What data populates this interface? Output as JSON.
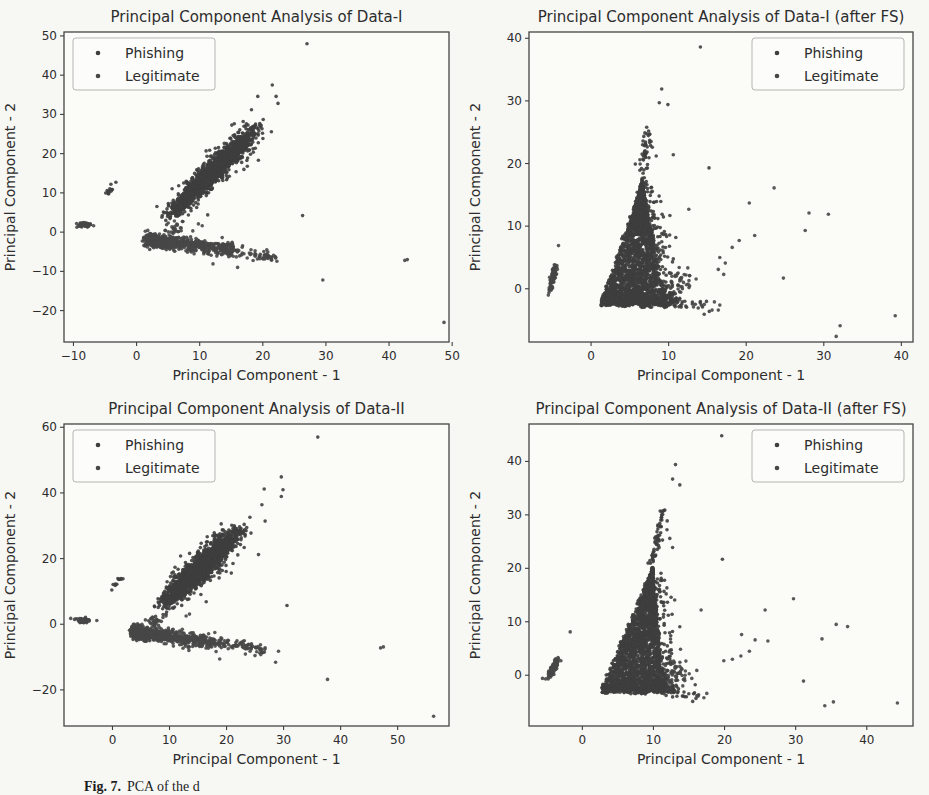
{
  "caption": {
    "label": "Fig. 7.",
    "text": "PCA of the d"
  },
  "colors": {
    "ink": "#2d2d2d",
    "tick": "#3f3f3f",
    "plot_border": "#454545",
    "plot_bg": "#fbfbf8",
    "paper_bg": "#f7f7f4",
    "legend_border": "#b5b5b0"
  },
  "chart_data": [
    {
      "type": "scatter",
      "title": "Principal Component Analysis of Data-I",
      "xlabel": "Principal Component - 1",
      "ylabel": "Principal Component - 2",
      "xlim": [
        -11.5,
        49.5
      ],
      "ylim": [
        -28,
        51
      ],
      "xticks": [
        -10,
        0,
        10,
        20,
        30,
        40,
        50
      ],
      "yticks": [
        -20,
        -10,
        0,
        10,
        20,
        30,
        40,
        50
      ],
      "legend": {
        "position": "top-left",
        "entries": [
          "Phishing",
          "Legitimate"
        ]
      },
      "seed": 101,
      "series": [
        {
          "name": "Phishing",
          "color": "#3e3e3e",
          "clusters": [
            {
              "shape": "band",
              "x0": 4.6,
              "y0": 3.2,
              "x1": 19.5,
              "y1": 27.0,
              "sigma": 1.15,
              "count": 1700,
              "bias": "center"
            },
            {
              "shape": "band",
              "x0": 5.0,
              "y0": 4.0,
              "x1": 20.5,
              "y1": 28.0,
              "sigma": 2.3,
              "count": 220,
              "bias": "center"
            },
            {
              "shape": "streak",
              "x0": -4.6,
              "y0": 9.8,
              "x1": -3.1,
              "y1": 13.2,
              "count": 12,
              "jitter": 0.25
            },
            {
              "shape": "points",
              "pts": [
                [
                  27,
                  48
                ],
                [
                  21.5,
                  37.5
                ],
                [
                  19.2,
                  34.6
                ],
                [
                  22.1,
                  34.6
                ],
                [
                  22.4,
                  32.8
                ],
                [
                  18.2,
                  31.2
                ],
                [
                  16.9,
                  28.2
                ],
                [
                  17.4,
                  27.6
                ],
                [
                  19.3,
                  18.3
                ],
                [
                  26.3,
                  4.2
                ],
                [
                  14.8,
                  23.9
                ],
                [
                  16.2,
                  25.4
                ]
              ]
            }
          ]
        },
        {
          "name": "Legitimate",
          "color": "#474747",
          "clusters": [
            {
              "shape": "band",
              "x0": 2.0,
              "y0": -2.0,
              "x1": 15.5,
              "y1": -4.6,
              "sigma": 0.85,
              "count": 650,
              "bias": "left"
            },
            {
              "shape": "band",
              "x0": 14.5,
              "y0": -4.6,
              "x1": 21.8,
              "y1": -6.8,
              "sigma": 0.8,
              "count": 70,
              "bias": "uniform"
            },
            {
              "shape": "blob",
              "cx": -8.3,
              "cy": 1.9,
              "rx": 1.0,
              "ry": 0.55,
              "count": 60
            },
            {
              "shape": "blob",
              "cx": 5.8,
              "cy": 1.2,
              "rx": 1.3,
              "ry": 1.5,
              "count": 26
            },
            {
              "shape": "points",
              "pts": [
                [
                  29.5,
                  -12.2
                ],
                [
                  42.5,
                  -7.2
                ],
                [
                  42.9,
                  -7.0
                ],
                [
                  48.7,
                  -23
                ],
                [
                  16,
                  -9
                ],
                [
                  12.1,
                  -8.1
                ],
                [
                  9.8,
                  2.1
                ],
                [
                  10.4,
                  1.6
                ],
                [
                  8.9,
                  0.3
                ],
                [
                  14.6,
                  -6.3
                ],
                [
                  11.8,
                  -5.9
                ],
                [
                  13.4,
                  -5.6
                ]
              ]
            }
          ]
        }
      ]
    },
    {
      "type": "scatter",
      "title": "Principal Component Analysis of Data-I (after FS)",
      "xlabel": "Principal Component - 1",
      "ylabel": "Principal Component - 2",
      "xlim": [
        -8,
        41.5
      ],
      "ylim": [
        -8.5,
        41
      ],
      "xticks": [
        0,
        10,
        20,
        30,
        40
      ],
      "yticks": [
        0,
        10,
        20,
        30,
        40
      ],
      "legend": {
        "position": "top-right",
        "entries": [
          "Phishing",
          "Legitimate"
        ]
      },
      "seed": 202,
      "series": [
        {
          "name": "Phishing",
          "color": "#3e3e3e",
          "clusters": [
            {
              "shape": "triangle",
              "bx0": 1.2,
              "bx1": 9.6,
              "by": -2.4,
              "ax": 6.6,
              "ay": 16.8,
              "count": 2500,
              "edge": 0.45
            },
            {
              "shape": "band",
              "x0": 6.6,
              "y0": 16.8,
              "x1": 7.3,
              "y1": 25.6,
              "sigma": 0.55,
              "count": 50,
              "bias": "uniform"
            },
            {
              "shape": "band",
              "x0": 9.8,
              "y0": -2.2,
              "x1": 15.8,
              "y1": -3.0,
              "sigma": 0.55,
              "count": 40,
              "bias": "left"
            },
            {
              "shape": "points",
              "pts": [
                [
                  14.1,
                  38.6
                ],
                [
                  9.1,
                  31.9
                ],
                [
                  8.8,
                  29.7
                ],
                [
                  9.9,
                  29.4
                ],
                [
                  15.2,
                  19.3
                ],
                [
                  10.6,
                  21.4
                ],
                [
                  5.7,
                  19.9
                ],
                [
                  6.3,
                  20.6
                ],
                [
                  7.9,
                  22.6
                ],
                [
                  8.4,
                  21.2
                ]
              ]
            }
          ]
        },
        {
          "name": "Legitimate",
          "color": "#474747",
          "clusters": [
            {
              "shape": "band",
              "x0": -5.4,
              "y0": -1.0,
              "x1": -4.5,
              "y1": 4.0,
              "sigma": 0.33,
              "count": 85,
              "bias": "center"
            },
            {
              "shape": "blob",
              "cx": 11.6,
              "cy": 1.4,
              "rx": 1.2,
              "ry": 2.4,
              "count": 32
            },
            {
              "shape": "points",
              "pts": [
                [
                  -4.2,
                  6.9
                ],
                [
                  16.6,
                  5.0
                ],
                [
                  17.3,
                  4.1
                ],
                [
                  16.4,
                  3.1
                ],
                [
                  17.1,
                  2.3
                ],
                [
                  18.2,
                  6.6
                ],
                [
                  19.1,
                  7.7
                ],
                [
                  21.1,
                  8.5
                ],
                [
                  20.4,
                  13.7
                ],
                [
                  23.6,
                  16.1
                ],
                [
                  28.1,
                  12.1
                ],
                [
                  30.6,
                  11.9
                ],
                [
                  27.6,
                  9.3
                ],
                [
                  24.8,
                  1.7
                ],
                [
                  12.6,
                  12.7
                ],
                [
                  14.6,
                  -2.5
                ],
                [
                  15.6,
                  -3.4
                ],
                [
                  16.4,
                  -3.4
                ],
                [
                  31.6,
                  -7.6
                ],
                [
                  32.1,
                  -5.9
                ],
                [
                  39.2,
                  -4.3
                ],
                [
                  13.2,
                  -2.9
                ],
                [
                  15.9,
                  -2.1
                ],
                [
                  16.6,
                  -2.6
                ]
              ]
            }
          ]
        }
      ]
    },
    {
      "type": "scatter",
      "title": "Principal Component Analysis of Data-II",
      "xlabel": "Principal Component - 1",
      "ylabel": "Principal Component - 2",
      "xlim": [
        -8.5,
        59
      ],
      "ylim": [
        -31,
        61
      ],
      "xticks": [
        0,
        10,
        20,
        30,
        40,
        50
      ],
      "yticks": [
        -20,
        0,
        20,
        40,
        60
      ],
      "legend": {
        "position": "top-left",
        "entries": [
          "Phishing",
          "Legitimate"
        ]
      },
      "seed": 303,
      "series": [
        {
          "name": "Phishing",
          "color": "#3e3e3e",
          "clusters": [
            {
              "shape": "band",
              "x0": 8.2,
              "y0": 4.8,
              "x1": 22.5,
              "y1": 29.0,
              "sigma": 1.5,
              "count": 1800,
              "bias": "center"
            },
            {
              "shape": "band",
              "x0": 9.0,
              "y0": 6.0,
              "x1": 23.5,
              "y1": 30.5,
              "sigma": 2.9,
              "count": 230,
              "bias": "center"
            },
            {
              "shape": "streak",
              "x0": -0.4,
              "y0": 9.9,
              "x1": 1.7,
              "y1": 14.3,
              "count": 11,
              "jitter": 0.3
            },
            {
              "shape": "points",
              "pts": [
                [
                  36,
                  57
                ],
                [
                  29.6,
                  44.9
                ],
                [
                  26.6,
                  41.2
                ],
                [
                  29.9,
                  41
                ],
                [
                  29.6,
                  38.9
                ],
                [
                  26.2,
                  36.4
                ],
                [
                  24.1,
                  32.6
                ],
                [
                  23.1,
                  30.4
                ],
                [
                  25.6,
                  21.2
                ],
                [
                  30.6,
                  5.7
                ],
                [
                  20.6,
                  26.4
                ],
                [
                  22.1,
                  28.1
                ]
              ]
            }
          ]
        },
        {
          "name": "Legitimate",
          "color": "#474747",
          "clusters": [
            {
              "shape": "band",
              "x0": 4.0,
              "y0": -2.6,
              "x1": 18.0,
              "y1": -5.4,
              "sigma": 1.0,
              "count": 700,
              "bias": "left"
            },
            {
              "shape": "band",
              "x0": 17.0,
              "y0": -5.2,
              "x1": 26.5,
              "y1": -7.8,
              "sigma": 0.9,
              "count": 90,
              "bias": "uniform"
            },
            {
              "shape": "blob",
              "cx": -5.1,
              "cy": 1.2,
              "rx": 1.1,
              "ry": 0.6,
              "count": 70
            },
            {
              "shape": "blob",
              "cx": 7.3,
              "cy": 0.8,
              "rx": 1.5,
              "ry": 1.7,
              "count": 30
            },
            {
              "shape": "points",
              "pts": [
                [
                  37.7,
                  -16.8
                ],
                [
                  47,
                  -7.2
                ],
                [
                  47.5,
                  -6.9
                ],
                [
                  56.3,
                  -28
                ],
                [
                  28.6,
                  -11.6
                ],
                [
                  18.8,
                  -10.6
                ],
                [
                  23.3,
                  -9.1
                ],
                [
                  29.1,
                  -8.2
                ],
                [
                  12.9,
                  2.5
                ],
                [
                  13.5,
                  3.1
                ]
              ]
            }
          ]
        }
      ]
    },
    {
      "type": "scatter",
      "title": "Principal Component Analysis of Data-II (after FS)",
      "xlabel": "Principal Component - 1",
      "ylabel": "Principal Component - 2",
      "xlim": [
        -7.5,
        46.5
      ],
      "ylim": [
        -9.5,
        47
      ],
      "xticks": [
        0,
        10,
        20,
        30,
        40
      ],
      "yticks": [
        0,
        10,
        20,
        30,
        40
      ],
      "legend": {
        "position": "top-right",
        "entries": [
          "Phishing",
          "Legitimate"
        ]
      },
      "seed": 404,
      "series": [
        {
          "name": "Phishing",
          "color": "#3e3e3e",
          "clusters": [
            {
              "shape": "triangle",
              "bx0": 2.6,
              "bx1": 11.6,
              "by": -2.9,
              "ax": 9.9,
              "ay": 19.8,
              "count": 2500,
              "edge": 0.5
            },
            {
              "shape": "band",
              "x0": 9.9,
              "y0": 19.8,
              "x1": 11.2,
              "y1": 30.6,
              "sigma": 0.6,
              "count": 55,
              "bias": "uniform"
            },
            {
              "shape": "band",
              "x0": 11.5,
              "y0": -2.6,
              "x1": 16.2,
              "y1": -3.6,
              "sigma": 0.55,
              "count": 40,
              "bias": "left"
            },
            {
              "shape": "points",
              "pts": [
                [
                  19.6,
                  44.8
                ],
                [
                  13.1,
                  39.4
                ],
                [
                  12.7,
                  36.7
                ],
                [
                  13.7,
                  35.6
                ],
                [
                  11.6,
                  30.9
                ],
                [
                  12.3,
                  25.6
                ],
                [
                  12.7,
                  23.9
                ],
                [
                  19.7,
                  21.7
                ],
                [
                  10.9,
                  28.4
                ],
                [
                  11.9,
                  27.2
                ]
              ]
            }
          ]
        },
        {
          "name": "Legitimate",
          "color": "#474747",
          "clusters": [
            {
              "shape": "band",
              "x0": -4.9,
              "y0": -0.7,
              "x1": -3.3,
              "y1": 3.2,
              "sigma": 0.38,
              "count": 90,
              "bias": "center"
            },
            {
              "shape": "blob",
              "cx": 13.2,
              "cy": 0.6,
              "rx": 1.5,
              "ry": 2.2,
              "count": 34
            },
            {
              "shape": "points",
              "pts": [
                [
                  -1.7,
                  8.1
                ],
                [
                  -5.6,
                  -0.6
                ],
                [
                  19.9,
                  2.7
                ],
                [
                  21.1,
                  3.0
                ],
                [
                  22.3,
                  3.6
                ],
                [
                  23.5,
                  4.5
                ],
                [
                  22.4,
                  7.6
                ],
                [
                  24.3,
                  6.6
                ],
                [
                  26.1,
                  6.4
                ],
                [
                  25.7,
                  12.2
                ],
                [
                  29.7,
                  14.3
                ],
                [
                  16.7,
                  12.2
                ],
                [
                  35.7,
                  9.5
                ],
                [
                  37.3,
                  9.1
                ],
                [
                  33.7,
                  6.8
                ],
                [
                  31.1,
                  -1.1
                ],
                [
                  34.1,
                  -5.7
                ],
                [
                  35.3,
                  -5.0
                ],
                [
                  44.3,
                  -5.2
                ],
                [
                  17.1,
                  -4.2
                ],
                [
                  16.3,
                  -3.9
                ],
                [
                  17.5,
                  -3.4
                ],
                [
                  16.1,
                  0.9
                ],
                [
                  15.4,
                  -0.6
                ]
              ]
            }
          ]
        }
      ]
    }
  ]
}
